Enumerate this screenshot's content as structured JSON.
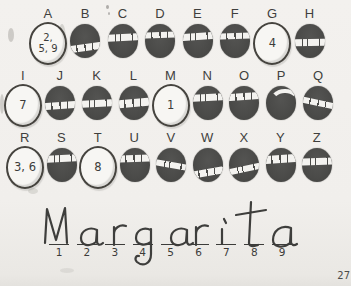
{
  "palette": {
    "paper": "#f1efec",
    "bubble_fill": "#4b4b49",
    "ink": "#3c3c3a",
    "scratch": "#f3f2ef"
  },
  "puzzle": {
    "rows": [
      [
        {
          "letter": "A",
          "open": true,
          "value_lines": [
            "2,",
            "5, 9"
          ]
        },
        {
          "letter": "B",
          "scratch": {
            "top": 58,
            "angle": -8,
            "h": 7,
            "variant": 0
          }
        },
        {
          "letter": "C",
          "scratch": {
            "top": 30,
            "angle": -3,
            "h": 7,
            "variant": 1
          }
        },
        {
          "letter": "D",
          "scratch": {
            "top": 24,
            "angle": -2,
            "h": 6,
            "variant": 0
          }
        },
        {
          "letter": "E",
          "scratch": {
            "top": 26,
            "angle": -4,
            "h": 7,
            "variant": 1
          }
        },
        {
          "letter": "F",
          "scratch": {
            "top": 26,
            "angle": -2,
            "h": 6,
            "variant": 0
          }
        },
        {
          "letter": "G",
          "open": true,
          "value_lines": [
            "4"
          ]
        },
        {
          "letter": "H",
          "scratch": {
            "top": 44,
            "angle": -1,
            "h": 7,
            "variant": 1
          }
        }
      ],
      [
        {
          "letter": "I",
          "open": true,
          "value_lines": [
            "7"
          ]
        },
        {
          "letter": "J",
          "scratch": {
            "top": 46,
            "angle": -4,
            "h": 7,
            "variant": 0
          }
        },
        {
          "letter": "K",
          "scratch": {
            "top": 42,
            "angle": -3,
            "h": 7,
            "variant": 1
          }
        },
        {
          "letter": "L",
          "scratch": {
            "top": 38,
            "angle": -5,
            "h": 8,
            "variant": 0
          }
        },
        {
          "letter": "M",
          "open": true,
          "value_lines": [
            "1"
          ]
        },
        {
          "letter": "N",
          "scratch": {
            "top": 24,
            "angle": -3,
            "h": 7,
            "variant": 1
          }
        },
        {
          "letter": "O",
          "scratch": {
            "top": 22,
            "angle": -4,
            "h": 7,
            "variant": 0
          }
        },
        {
          "letter": "P",
          "scratch": {
            "top": 16,
            "angle": -6,
            "h": 6,
            "variant": 1,
            "arc": true
          }
        },
        {
          "letter": "Q",
          "scratch": {
            "top": 40,
            "angle": 12,
            "h": 6,
            "variant": 0
          }
        }
      ],
      [
        {
          "letter": "R",
          "open": true,
          "value_lines": [
            "3, 6"
          ]
        },
        {
          "letter": "S",
          "scratch": {
            "top": 20,
            "angle": -3,
            "h": 7,
            "variant": 1
          }
        },
        {
          "letter": "T",
          "open": true,
          "value_lines": [
            "8"
          ]
        },
        {
          "letter": "U",
          "scratch": {
            "top": 22,
            "angle": -2,
            "h": 7,
            "variant": 0
          }
        },
        {
          "letter": "V",
          "scratch": {
            "top": 42,
            "angle": 10,
            "h": 6,
            "variant": 1
          }
        },
        {
          "letter": "W",
          "scratch": {
            "top": 62,
            "angle": -10,
            "h": 7,
            "variant": 0
          }
        },
        {
          "letter": "X",
          "scratch": {
            "top": 52,
            "angle": -12,
            "h": 6,
            "variant": 1
          }
        },
        {
          "letter": "Y",
          "scratch": {
            "top": 22,
            "angle": -4,
            "h": 8,
            "variant": 0
          }
        },
        {
          "letter": "Z",
          "scratch": {
            "top": 30,
            "angle": -2,
            "h": 7,
            "variant": 1
          }
        }
      ]
    ]
  },
  "answer": {
    "word": "Margarita",
    "blank_numbers": [
      "1",
      "2",
      "3",
      "4",
      "5",
      "6",
      "7",
      "8",
      "9"
    ]
  },
  "page_number": "27"
}
